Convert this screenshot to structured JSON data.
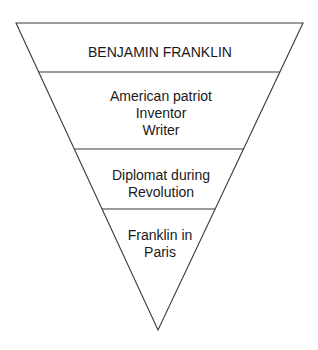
{
  "diagram": {
    "type": "inverted-pyramid",
    "colors": {
      "background": "#ffffff",
      "line": "#3a3a3a",
      "text": "#1a1a1a"
    },
    "layers": [
      {
        "id": "layer-1",
        "lines": [
          "BENJAMIN FRANKLIN"
        ]
      },
      {
        "id": "layer-2",
        "lines": [
          "American patriot",
          "Inventor",
          "Writer"
        ]
      },
      {
        "id": "layer-3",
        "lines": [
          "Diplomat during",
          "Revolution"
        ]
      },
      {
        "id": "layer-4",
        "lines": [
          "Franklin in",
          "Paris"
        ]
      }
    ]
  }
}
